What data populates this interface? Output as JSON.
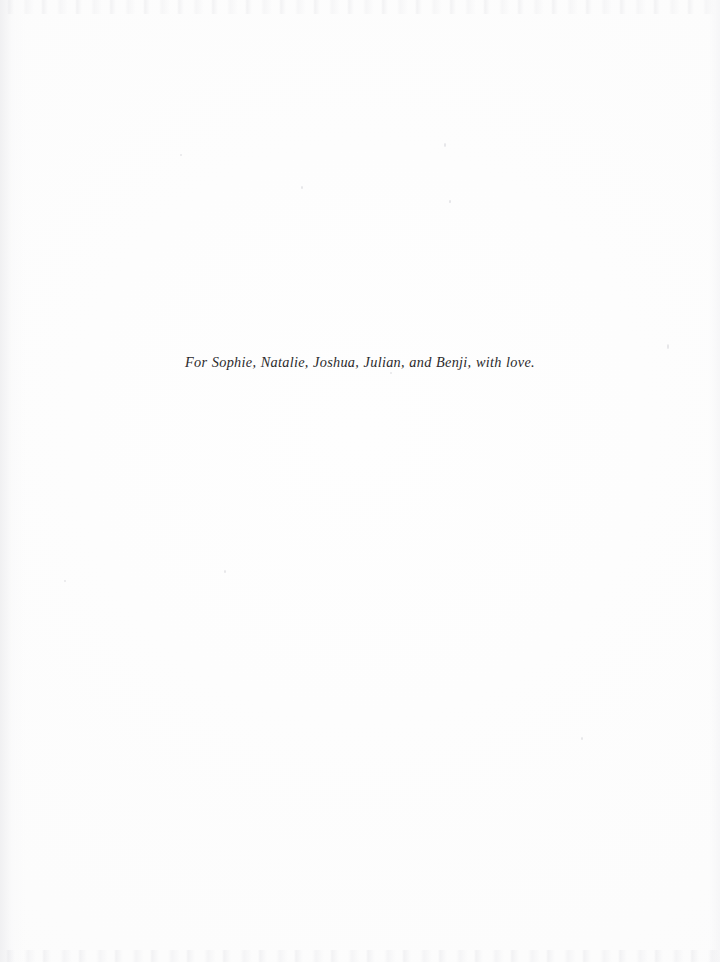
{
  "page": {
    "kind": "book-dedication-page",
    "background_color": "#fefefe",
    "width_px": 720,
    "height_px": 962
  },
  "dedication": {
    "text": "For Sophie, Natalie, Joshua, Julian, and Benji, with love.",
    "style": "italic-serif",
    "text_color": "#2b2a2c",
    "alignment": "center"
  }
}
